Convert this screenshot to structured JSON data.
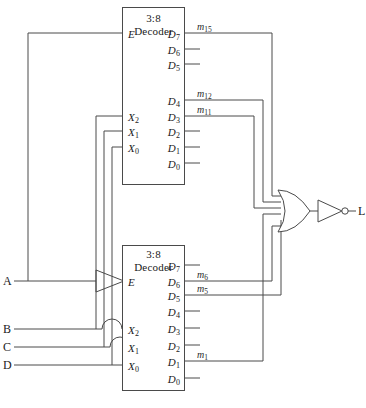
{
  "diagram": {
    "title_caption": "",
    "upper_decoder": {
      "name": "3:8",
      "name2": "Decoder",
      "enable_label": "E",
      "addr_labels": [
        "X",
        "X",
        "X"
      ],
      "addr_subs": [
        "2",
        "1",
        "0"
      ],
      "out_label": "D",
      "out_subs": [
        "7",
        "6",
        "5",
        "4",
        "3",
        "2",
        "1",
        "0"
      ],
      "minterms": {
        "D7": "m",
        "D7_sub": "15",
        "D4": "m",
        "D4_sub": "12",
        "D3": "m",
        "D3_sub": "11"
      }
    },
    "lower_decoder": {
      "name": "3:8",
      "name2": "Decoder",
      "enable_label": "E",
      "addr_labels": [
        "X",
        "X",
        "X"
      ],
      "addr_subs": [
        "2",
        "1",
        "0"
      ],
      "out_label": "D",
      "out_subs": [
        "7",
        "6",
        "5",
        "4",
        "3",
        "2",
        "1",
        "0"
      ],
      "minterms": {
        "D6": "m",
        "D6_sub": "6",
        "D5": "m",
        "D5_sub": "5",
        "D1": "m",
        "D1_sub": "1"
      }
    },
    "inputs": [
      {
        "label": "A"
      },
      {
        "label": "B"
      },
      {
        "label": "C"
      },
      {
        "label": "D"
      }
    ],
    "output": {
      "label": "L"
    },
    "gates": {
      "input_inverter": "not-gate",
      "or_gate": "or-gate",
      "output_inverter": "not-gate"
    },
    "colors": {
      "wire": "#4a4a4a",
      "box_border": "#4a4a4a",
      "text": "#1a1a1a",
      "background": "#ffffff"
    }
  }
}
